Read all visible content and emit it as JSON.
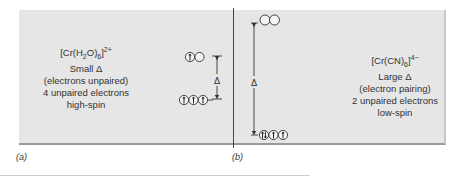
{
  "panels": {
    "a": {
      "label": "(a)",
      "formula_main": "[Cr(H",
      "formula_sub1": "2",
      "formula_mid": "O)",
      "formula_sub2": "6",
      "formula_close": "]",
      "formula_charge": "2+",
      "lines": [
        "Small Δ",
        "(electrons unpaired)",
        "4 unpaired electrons",
        "high-spin"
      ],
      "delta_symbol": "Δ",
      "upper_orbitals": [
        "up",
        "empty"
      ],
      "lower_orbitals": [
        "up",
        "up",
        "up"
      ]
    },
    "b": {
      "label": "(b)",
      "formula_main": "[Cr(CN)",
      "formula_sub": "6",
      "formula_close": "]",
      "formula_charge": "4−",
      "lines": [
        "Large Δ",
        "(electron pairing)",
        "2 unpaired electrons",
        "low-spin"
      ],
      "delta_symbol": "Δ",
      "upper_orbitals": [
        "empty",
        "empty"
      ],
      "lower_orbitals": [
        "paired",
        "up",
        "up"
      ]
    }
  },
  "colors": {
    "panel_bg": "#e6e6e6",
    "ink": "#333333"
  }
}
